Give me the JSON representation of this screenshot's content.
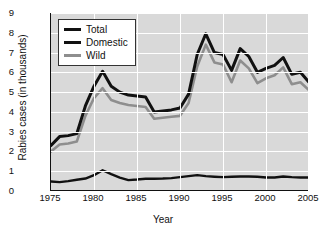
{
  "chart_data": {
    "type": "line",
    "title": "",
    "xlabel": "Year",
    "ylabel": "Rabies cases (in thousands)",
    "xlim": [
      1975,
      2005
    ],
    "ylim": [
      0,
      9
    ],
    "xticks": [
      "1975",
      "1980",
      "1985",
      "1990",
      "1995",
      "2000",
      "2005"
    ],
    "yticks": [
      "0",
      "1",
      "2",
      "3",
      "4",
      "5",
      "6",
      "7",
      "8",
      "9"
    ],
    "grid": true,
    "legend_position": "upper left",
    "x": [
      1975,
      1976,
      1977,
      1978,
      1979,
      1980,
      1981,
      1982,
      1983,
      1984,
      1985,
      1986,
      1987,
      1988,
      1989,
      1990,
      1991,
      1992,
      1993,
      1994,
      1995,
      1996,
      1997,
      1998,
      1999,
      2000,
      2001,
      2002,
      2003,
      2004,
      2005
    ],
    "series": [
      {
        "name": "Total",
        "color": "#111111",
        "values": [
          2.3,
          2.75,
          2.8,
          2.9,
          4.3,
          5.3,
          6.05,
          5.3,
          5.0,
          4.85,
          4.8,
          4.75,
          4.0,
          4.05,
          4.1,
          4.2,
          4.9,
          6.9,
          7.95,
          7.0,
          6.9,
          6.1,
          7.2,
          6.8,
          6.0,
          6.2,
          6.35,
          6.75,
          5.9,
          6.0,
          5.5
        ]
      },
      {
        "name": "Domestic",
        "color": "#111111",
        "values": [
          0.48,
          0.45,
          0.5,
          0.57,
          0.63,
          0.8,
          1.05,
          0.85,
          0.68,
          0.55,
          0.58,
          0.62,
          0.62,
          0.63,
          0.65,
          0.7,
          0.75,
          0.8,
          0.75,
          0.72,
          0.7,
          0.72,
          0.73,
          0.73,
          0.72,
          0.68,
          0.68,
          0.73,
          0.7,
          0.68,
          0.68
        ]
      },
      {
        "name": "Wild",
        "color": "#8e8e8e",
        "values": [
          2.0,
          2.35,
          2.4,
          2.5,
          3.8,
          4.7,
          5.2,
          4.6,
          4.45,
          4.35,
          4.3,
          4.25,
          3.65,
          3.7,
          3.75,
          3.8,
          4.45,
          6.3,
          7.4,
          6.5,
          6.4,
          5.5,
          6.6,
          6.2,
          5.45,
          5.7,
          5.85,
          6.25,
          5.4,
          5.5,
          5.1
        ]
      }
    ]
  },
  "legend": {
    "items": [
      {
        "label": "Total",
        "color": "#111111",
        "thickness": "3.2px"
      },
      {
        "label": "Domestic",
        "color": "#111111",
        "thickness": "2.6px"
      },
      {
        "label": "Wild",
        "color": "#8e8e8e",
        "thickness": "2.6px"
      }
    ]
  }
}
